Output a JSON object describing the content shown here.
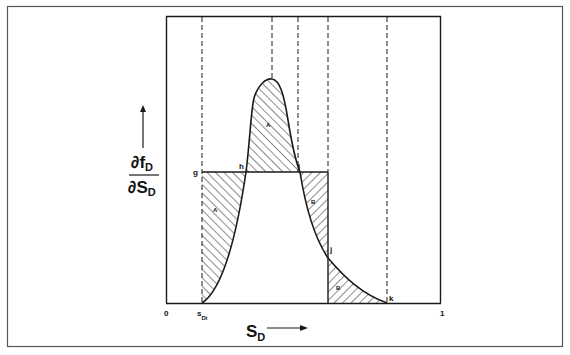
{
  "figure": {
    "y_axis_label": {
      "numerator": "∂f",
      "numerator_sub": "D",
      "denominator": "∂S",
      "denominator_sub": "D"
    },
    "x_axis_label": {
      "main": "S",
      "sub": "D"
    },
    "x_ticks": {
      "origin": "0",
      "s_di_main": "s",
      "s_di_sub": "Di",
      "end": "1"
    },
    "points": {
      "g": "g",
      "h": "h",
      "i": "i",
      "j": "j",
      "k": "k"
    },
    "regions": [
      {
        "label": "A",
        "description": "area below g-line left of curve"
      },
      {
        "label": "A",
        "description": "area under peak above g-line"
      },
      {
        "label": "B",
        "description": "area above curve below g-line"
      },
      {
        "label": "B",
        "description": "area under tail right of j"
      }
    ],
    "colors": {
      "ink": "#1a1a1a",
      "background": "#ffffff",
      "frame": "#555555"
    }
  }
}
